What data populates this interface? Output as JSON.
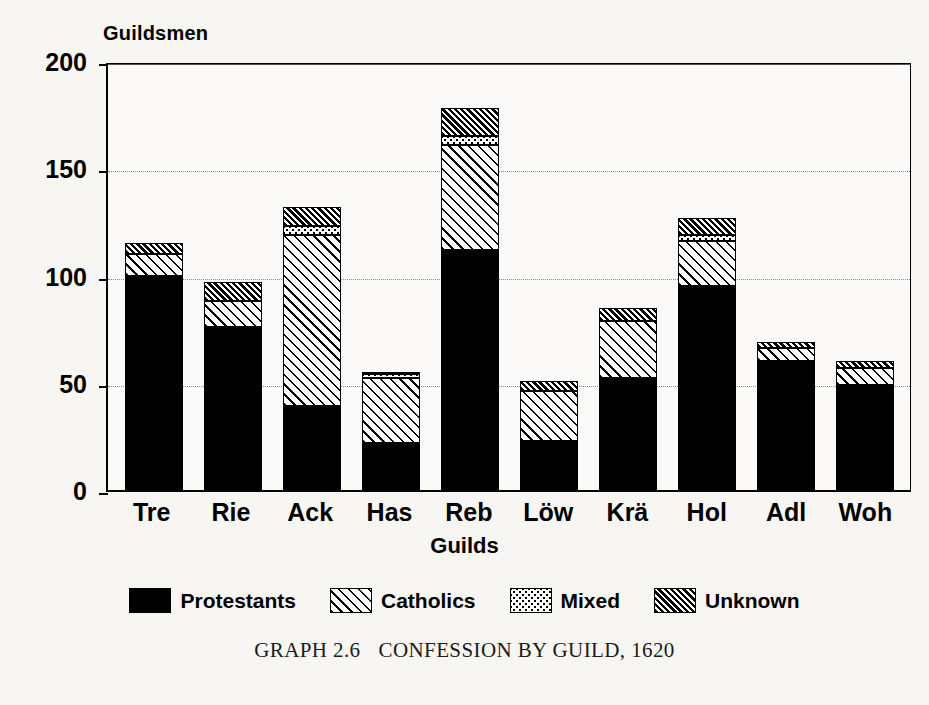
{
  "chart_data": {
    "type": "bar",
    "subtype": "stacked",
    "caption_number": "GRAPH 2.6",
    "caption_text": "CONFESSION BY GUILD, 1620",
    "xlabel": "Guilds",
    "ylabel": "Guildsmen",
    "ylim": [
      0,
      200
    ],
    "yticks": [
      0,
      50,
      100,
      150,
      200
    ],
    "ytick_labels": [
      "0",
      "50",
      "100",
      "150",
      "200"
    ],
    "grid": true,
    "grid_axis": "y",
    "legend_position": "bottom",
    "categories": [
      "Tre",
      "Rie",
      "Ack",
      "Has",
      "Reb",
      "Löw",
      "Krä",
      "Hol",
      "Adl",
      "Woh"
    ],
    "series": [
      {
        "name": "Protestants",
        "pattern": "solid-black",
        "color": "#000000",
        "values": [
          100,
          76,
          39,
          22,
          112,
          23,
          52,
          95,
          60,
          49
        ]
      },
      {
        "name": "Catholics",
        "pattern": "diagonal-hatch",
        "color": "#000000",
        "values": [
          10,
          12,
          80,
          30,
          49,
          23,
          27,
          21,
          6,
          8
        ]
      },
      {
        "name": "Mixed",
        "pattern": "dotted",
        "color": "#000000",
        "values": [
          0,
          0,
          4,
          2,
          4,
          0,
          0,
          3,
          0,
          0
        ]
      },
      {
        "name": "Unknown",
        "pattern": "dense-diagonal-hatch",
        "color": "#000000",
        "values": [
          5,
          9,
          9,
          1,
          13,
          5,
          6,
          8,
          3,
          3
        ]
      }
    ],
    "totals": [
      115,
      97,
      132,
      55,
      178,
      51,
      85,
      127,
      69,
      60
    ]
  },
  "legend": {
    "items": [
      {
        "label": "Protestants",
        "swatch": "solid-black-swatch"
      },
      {
        "label": "Catholics",
        "swatch": "diagonal-hatch-swatch"
      },
      {
        "label": "Mixed",
        "swatch": "dotted-swatch"
      },
      {
        "label": "Unknown",
        "swatch": "dense-hatch-swatch"
      }
    ]
  }
}
